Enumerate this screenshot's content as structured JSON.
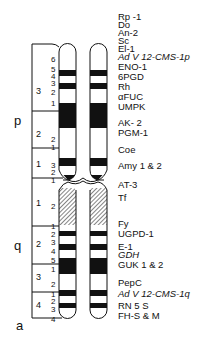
{
  "arms": {
    "p": "p",
    "q": "q",
    "a": "a"
  },
  "regions": [
    {
      "label": "3",
      "y": 92
    },
    {
      "label": "2",
      "y": 135
    },
    {
      "label": "1",
      "y": 165
    },
    {
      "label": "1",
      "y": 204
    },
    {
      "label": "2",
      "y": 245
    },
    {
      "label": "3",
      "y": 278
    },
    {
      "label": "4",
      "y": 306
    }
  ],
  "bands": [
    {
      "label": "6",
      "y": 60
    },
    {
      "label": "5",
      "y": 70
    },
    {
      "label": "4",
      "y": 77
    },
    {
      "label": "3",
      "y": 84
    },
    {
      "label": "2",
      "y": 93
    },
    {
      "label": "1",
      "y": 104
    },
    {
      "label": "2",
      "y": 140
    },
    {
      "label": "1",
      "y": 148
    },
    {
      "label": "3",
      "y": 166
    },
    {
      "label": "2",
      "y": 173
    },
    {
      "label": "1",
      "y": 181
    },
    {
      "label": "2",
      "y": 207
    },
    {
      "label": "1",
      "y": 227
    },
    {
      "label": "2",
      "y": 235
    },
    {
      "label": "3",
      "y": 243
    },
    {
      "label": "4",
      "y": 252
    },
    {
      "label": "5",
      "y": 261
    },
    {
      "label": "1",
      "y": 270
    },
    {
      "label": "2",
      "y": 285
    },
    {
      "label": "1",
      "y": 295
    },
    {
      "label": "2",
      "y": 302
    },
    {
      "label": "3",
      "y": 310
    },
    {
      "label": "4",
      "y": 320
    }
  ],
  "genes": [
    {
      "label": "Rp -1",
      "y": 17,
      "italic": false
    },
    {
      "label": "Do",
      "y": 25,
      "italic": false
    },
    {
      "label": "An-2",
      "y": 33,
      "italic": false
    },
    {
      "label": "Sc",
      "y": 41,
      "italic": false
    },
    {
      "label": "El-1",
      "y": 49,
      "italic": false
    },
    {
      "label": "Ad V 12-CMS-1p",
      "y": 57,
      "italic": true
    },
    {
      "label": "ENO-1",
      "y": 67,
      "italic": false
    },
    {
      "label": "6PGD",
      "y": 77,
      "italic": false
    },
    {
      "label": "Rh",
      "y": 87,
      "italic": false
    },
    {
      "label": "αFUC",
      "y": 97,
      "italic": false
    },
    {
      "label": "UMPK",
      "y": 107,
      "italic": false
    },
    {
      "label": "AK- 2",
      "y": 123,
      "italic": false
    },
    {
      "label": "PGM-1",
      "y": 133,
      "italic": false
    },
    {
      "label": "Coe",
      "y": 150,
      "italic": false
    },
    {
      "label": "Amy 1 & 2",
      "y": 166,
      "italic": false
    },
    {
      "label": "AT-3",
      "y": 185,
      "italic": false
    },
    {
      "label": "Tf",
      "y": 198,
      "italic": false
    },
    {
      "label": "Fy",
      "y": 224,
      "italic": false
    },
    {
      "label": "UGPD-1",
      "y": 234,
      "italic": false
    },
    {
      "label": "E-1",
      "y": 247,
      "italic": false
    },
    {
      "label": "GDH",
      "y": 255,
      "italic": true
    },
    {
      "label": "GUK 1 & 2",
      "y": 265,
      "italic": false
    },
    {
      "label": "PepC",
      "y": 283,
      "italic": false
    },
    {
      "label": "Ad V 12-CMS-1q",
      "y": 294,
      "italic": true
    },
    {
      "label": "RN 5 S",
      "y": 306,
      "italic": false
    },
    {
      "label": "FH-S & M",
      "y": 316,
      "italic": false
    }
  ],
  "colors": {
    "ink": "#111111",
    "paper": "#ffffff"
  }
}
